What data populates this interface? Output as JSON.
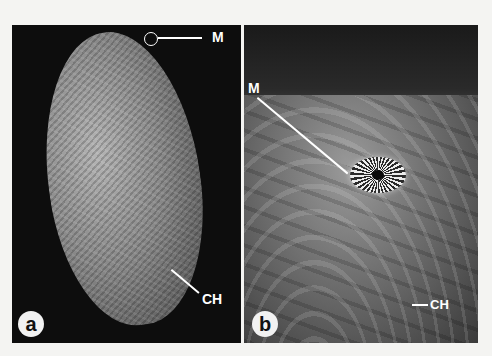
{
  "figure": {
    "panels": [
      {
        "id": "a",
        "badge": "a",
        "description": "SEM micrograph of whole oval seed with wrinkled surface",
        "labels": [
          {
            "text": "M",
            "meaning": "micropyle (circled at seed tip)"
          },
          {
            "text": "CH"
          }
        ]
      },
      {
        "id": "b",
        "badge": "b",
        "description": "Close-up SEM micrograph of seed surface showing radiating micropyle",
        "labels": [
          {
            "text": "M"
          },
          {
            "text": "CH"
          }
        ]
      }
    ]
  }
}
